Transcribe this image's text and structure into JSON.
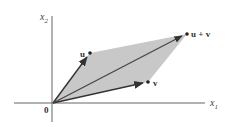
{
  "diagram": {
    "type": "parallelogram-vector-addition",
    "colors": {
      "background": "#ffffff",
      "fill": "#c8c8c8",
      "axis": "#555555",
      "vector": "#333333",
      "text": "#333333"
    },
    "axes": {
      "x_label": "x",
      "x_sub": "1",
      "y_label": "x",
      "y_sub": "2"
    },
    "points": {
      "origin": {
        "label": "0",
        "x": 53,
        "y": 103
      },
      "u": {
        "label": "u",
        "x": 90,
        "y": 53
      },
      "v": {
        "label": "v",
        "x": 148,
        "y": 82
      },
      "u_plus_v": {
        "label": "u + v",
        "x": 187,
        "y": 34
      }
    }
  }
}
